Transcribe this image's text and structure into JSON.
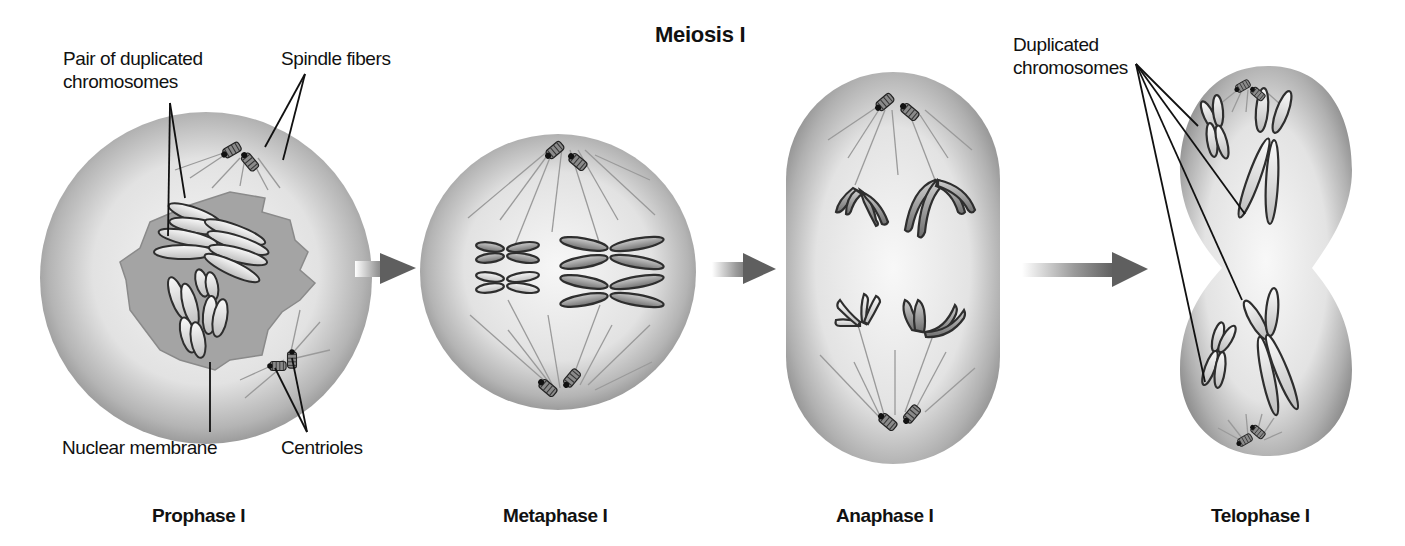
{
  "title": "Meiosis I",
  "stages": [
    {
      "id": "prophase",
      "label": "Prophase I"
    },
    {
      "id": "metaphase",
      "label": "Metaphase I"
    },
    {
      "id": "anaphase",
      "label": "Anaphase I"
    },
    {
      "id": "telophase",
      "label": "Telophase I"
    }
  ],
  "callouts": {
    "pair_of_duplicated_chromosomes": [
      "Pair of duplicated",
      "chromosomes"
    ],
    "spindle_fibers": "Spindle fibers",
    "nuclear_membrane": "Nuclear membrane",
    "centrioles": "Centrioles",
    "duplicated_chromosomes": [
      "Duplicated",
      "chromosomes"
    ]
  },
  "colors": {
    "cell_fill_light": "#f2f2f2",
    "cell_fill_dark": "#8a8a8a",
    "nucleus": "#9a9a9a",
    "chromosome_outline": "#2e2e2e",
    "arrow": "#5f5f5f",
    "leader_line": "#111111"
  }
}
